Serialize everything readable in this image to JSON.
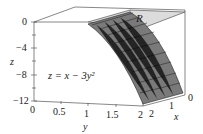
{
  "figure": {
    "equation": "z = x − 3y²",
    "region_label": "R",
    "z_axis": {
      "label": "z",
      "ticks": [
        "0",
        "−4",
        "−8",
        "−12"
      ]
    },
    "y_axis": {
      "label": "y",
      "ticks": [
        "0",
        "0.5",
        "1",
        "1.5",
        "2"
      ]
    },
    "x_axis": {
      "label": "x",
      "ticks": [
        "2",
        "1",
        "0"
      ]
    },
    "colors": {
      "region_fill": "#d9d9d9",
      "surface_fill": "#7a7a7a",
      "grid_lines": "#111111",
      "box_lines": "#555555"
    }
  }
}
